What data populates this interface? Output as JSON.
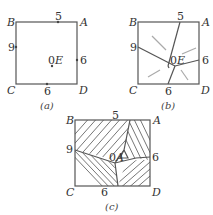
{
  "panels": [
    {
      "id": "a",
      "caption": "(a)",
      "corners": {
        "B": "B",
        "A": "A",
        "C": "C",
        "D": "D"
      },
      "points": {
        "top": "5",
        "left": "9",
        "right": "6",
        "bottom": "6",
        "center": "0",
        "center_label": "E"
      }
    },
    {
      "id": "b",
      "caption": "(b)",
      "corners": {
        "B": "B",
        "A": "A",
        "C": "C",
        "D": "D"
      },
      "points": {
        "top": "5",
        "left": "9",
        "right": "6",
        "bottom": "6",
        "center": "0",
        "center_label": "E"
      }
    },
    {
      "id": "c",
      "caption": "(c)",
      "corners": {
        "B": "B",
        "A": "A",
        "C": "C",
        "D": "D"
      },
      "points": {
        "top": "5",
        "left": "9",
        "right": "6",
        "bottom": "6",
        "center": "0",
        "center_label": "A"
      }
    }
  ]
}
